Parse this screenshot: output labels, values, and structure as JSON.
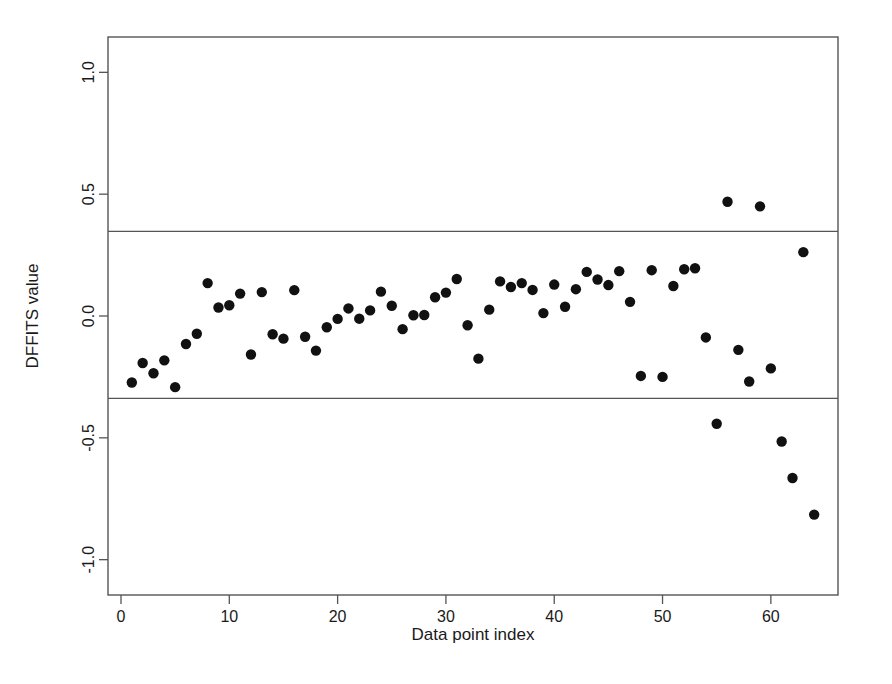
{
  "chart_data": {
    "type": "scatter",
    "title": "",
    "xlabel": "Data point index",
    "ylabel": "DFFITS value",
    "xlim": [
      -1.2,
      66.2
    ],
    "ylim": [
      -1.145,
      1.145
    ],
    "xticks": [
      0,
      10,
      20,
      30,
      40,
      50,
      60
    ],
    "xtick_labels": [
      "0",
      "10",
      "20",
      "30",
      "40",
      "50",
      "60"
    ],
    "yticks": [
      -1.0,
      -0.5,
      0.0,
      0.5,
      1.0
    ],
    "ytick_labels": [
      "-1.0",
      "-0.5",
      "0.0",
      "0.5",
      "1.0"
    ],
    "grid": false,
    "legend": false,
    "marker": "filled-circle",
    "marker_color": "#111111",
    "marker_size": 5.2,
    "reference_lines": [
      {
        "name": "upper-threshold",
        "orientation": "horizontal",
        "value": 0.347,
        "color": "#555555"
      },
      {
        "name": "lower-threshold",
        "orientation": "horizontal",
        "value": -0.338,
        "color": "#555555"
      }
    ],
    "x": [
      1,
      2,
      3,
      4,
      5,
      6,
      7,
      8,
      9,
      10,
      11,
      12,
      13,
      14,
      15,
      16,
      17,
      18,
      19,
      20,
      21,
      22,
      23,
      24,
      25,
      26,
      27,
      28,
      29,
      30,
      31,
      32,
      33,
      34,
      35,
      36,
      37,
      38,
      39,
      40,
      41,
      42,
      43,
      44,
      45,
      46,
      47,
      48,
      49,
      50,
      51,
      52,
      53,
      54,
      55,
      56,
      57,
      58,
      59,
      60,
      61,
      62,
      63,
      64
    ],
    "y": [
      -0.273,
      -0.193,
      -0.235,
      -0.182,
      -0.292,
      -0.115,
      -0.073,
      0.135,
      0.035,
      0.044,
      0.092,
      -0.158,
      0.098,
      -0.075,
      -0.093,
      0.106,
      -0.085,
      -0.142,
      -0.046,
      -0.012,
      0.031,
      -0.011,
      0.023,
      0.1,
      0.042,
      -0.054,
      0.003,
      0.004,
      0.077,
      0.096,
      0.152,
      -0.038,
      -0.175,
      0.026,
      0.142,
      0.119,
      0.135,
      0.107,
      0.012,
      0.129,
      0.038,
      0.11,
      0.181,
      0.15,
      0.127,
      0.184,
      0.058,
      -0.246,
      0.188,
      -0.25,
      0.123,
      0.192,
      0.196,
      -0.088,
      -0.442,
      0.469,
      -0.139,
      -0.269,
      0.45,
      -0.215,
      -0.515,
      -0.665,
      0.262,
      -0.815
    ],
    "series": [
      {
        "name": "DFFITS values",
        "values": [
          -0.273,
          -0.193,
          -0.235,
          -0.182,
          -0.292,
          -0.115,
          -0.073,
          0.135,
          0.035,
          0.044,
          0.092,
          -0.158,
          0.098,
          -0.075,
          -0.093,
          0.106,
          -0.085,
          -0.142,
          -0.046,
          -0.012,
          0.031,
          -0.011,
          0.023,
          0.1,
          0.042,
          -0.054,
          0.003,
          0.004,
          0.077,
          0.096,
          0.152,
          -0.038,
          -0.175,
          0.026,
          0.142,
          0.119,
          0.135,
          0.107,
          0.012,
          0.129,
          0.038,
          0.11,
          0.181,
          0.15,
          0.127,
          0.184,
          0.058,
          -0.246,
          0.188,
          -0.25,
          0.123,
          0.192,
          0.196,
          -0.088,
          -0.442,
          0.469,
          -0.139,
          -0.269,
          0.45,
          -0.215,
          -0.515,
          -0.665,
          0.262,
          -0.815
        ]
      }
    ]
  },
  "figure": {
    "background_color": "#ffffff",
    "frame_color": "#555555"
  }
}
